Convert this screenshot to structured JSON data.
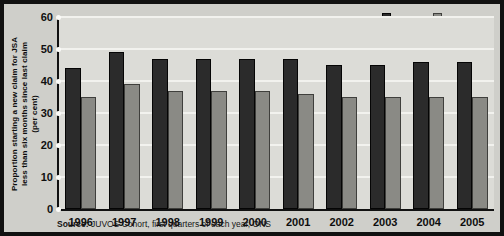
{
  "chart_data": {
    "type": "bar",
    "title": "",
    "subtitle": "",
    "xlabel": "",
    "ylabel": "Proportion starting a new claim for JSA less than six months since last claim (per cent)",
    "ylabel_lines": [
      "Proportion starting a new claim for JSA",
      "less than six months since last claim",
      "(per cent)"
    ],
    "categories": [
      "1996",
      "1997",
      "1998",
      "1999",
      "2000",
      "2001",
      "2002",
      "2003",
      "2004",
      "2005"
    ],
    "series": [
      {
        "name": "Men",
        "color": "#2b2b2b",
        "values": [
          44,
          49,
          47,
          47,
          47,
          47,
          45,
          45,
          46,
          46
        ]
      },
      {
        "name": "Women",
        "color": "#8a8a85",
        "values": [
          35,
          39,
          37,
          37,
          37,
          36,
          35,
          35,
          35,
          35
        ]
      }
    ],
    "ylim": [
      0,
      60
    ],
    "yticks": [
      0,
      10,
      20,
      30,
      40,
      50,
      60
    ],
    "ytick_labels": [
      "0",
      "10",
      "20",
      "30",
      "40",
      "50",
      "60"
    ],
    "grid": true,
    "legend_position": "top-right"
  },
  "legend": {
    "items": [
      {
        "label": "Men",
        "color": "#2b2b2b"
      },
      {
        "label": "Women",
        "color": "#8a8a85"
      }
    ]
  },
  "source": {
    "label": "Source:",
    "text": "JUVOS Cohort, first quarters of each year, ONS",
    "full": "Source: JUVOS Cohort, first quarters of each year, ONS"
  },
  "colors": {
    "men": "#2b2b2b",
    "women": "#8a8a85",
    "plot_background": "#dcdcd7",
    "panel_background": "#cfcfca",
    "gridline": "#f2f2ee",
    "axis": "#111111",
    "border": "#111111"
  }
}
